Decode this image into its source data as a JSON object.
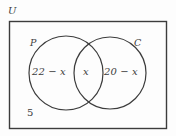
{
  "diagram": {
    "type": "venn-two-set",
    "universe": {
      "label": "U",
      "outside_count": "5"
    },
    "sets": [
      {
        "id": "P",
        "label": "P",
        "only_value": "22 − x"
      },
      {
        "id": "C",
        "label": "C",
        "only_value": "20 − x"
      }
    ],
    "intersection": {
      "label": "P ∩ C",
      "value": "x"
    },
    "regions": [
      {
        "name": "p-only",
        "text": "22 − x"
      },
      {
        "name": "intersection",
        "text": "x"
      },
      {
        "name": "c-only",
        "text": "20 − x"
      },
      {
        "name": "outside",
        "text": "5"
      }
    ],
    "colors": {
      "stroke": "#3c3c3c",
      "background": "#fdfdfd",
      "text": "#3c3c3c"
    }
  }
}
